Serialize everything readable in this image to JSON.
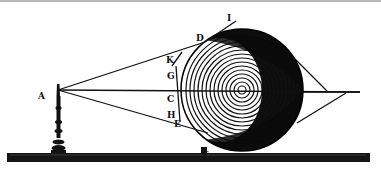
{
  "figure": {
    "colors": {
      "ink": "#111111",
      "paper": "#ffffff",
      "top_rule": "#b8b8b8"
    },
    "labels": {
      "A": "A",
      "I": "I",
      "D": "D",
      "K": "K",
      "G": "G",
      "C": "C",
      "H": "H",
      "E": "E",
      "F": "F"
    },
    "objects": {
      "candle": "candle-icon",
      "sphere": "sphere-icon",
      "ground": "ground-bar"
    }
  }
}
